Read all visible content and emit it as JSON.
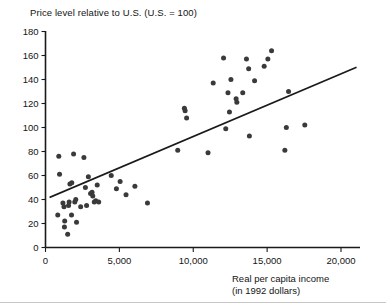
{
  "chart_data": {
    "type": "scatter",
    "title": "Price level relative to U.S. (U.S. = 100)",
    "xlabel": "Real per capita income",
    "xlabel_sub": "(in 1992 dollars)",
    "ylabel": "Price level relative to U.S. (U.S. = 100)",
    "xlim": [
      0,
      21500
    ],
    "ylim": [
      0,
      180
    ],
    "xticks": [
      0,
      5000,
      10000,
      15000,
      20000
    ],
    "xtick_labels": [
      "0",
      "5,000",
      "10,000",
      "15,000",
      "20,000"
    ],
    "yticks": [
      0,
      20,
      40,
      60,
      80,
      100,
      120,
      140,
      160,
      180
    ],
    "ytick_labels": [
      "0",
      "20",
      "40",
      "60",
      "80",
      "100",
      "120",
      "140",
      "160",
      "180"
    ],
    "grid": false,
    "legend": false,
    "point_color": "#3a3a3a",
    "line_color": "#1a1a1a",
    "series": [
      {
        "name": "Countries",
        "marker": "circle",
        "points": [
          [
            900,
            76
          ],
          [
            950,
            61
          ],
          [
            830,
            27
          ],
          [
            1180,
            37
          ],
          [
            1250,
            34
          ],
          [
            1300,
            22
          ],
          [
            1280,
            17
          ],
          [
            1500,
            11
          ],
          [
            1560,
            35
          ],
          [
            1600,
            38
          ],
          [
            1650,
            53
          ],
          [
            1780,
            54
          ],
          [
            1760,
            27
          ],
          [
            1900,
            78
          ],
          [
            1980,
            38
          ],
          [
            2050,
            40
          ],
          [
            2100,
            21
          ],
          [
            2380,
            34
          ],
          [
            2600,
            75
          ],
          [
            2700,
            50
          ],
          [
            2780,
            35
          ],
          [
            2900,
            59
          ],
          [
            3050,
            45
          ],
          [
            3150,
            46
          ],
          [
            3200,
            43
          ],
          [
            3300,
            38
          ],
          [
            3400,
            39
          ],
          [
            3500,
            52
          ],
          [
            3600,
            38
          ],
          [
            4450,
            60
          ],
          [
            4800,
            49
          ],
          [
            5050,
            55
          ],
          [
            5450,
            44
          ],
          [
            6050,
            51
          ],
          [
            6900,
            37
          ],
          [
            8950,
            81
          ],
          [
            9400,
            116
          ],
          [
            9450,
            114
          ],
          [
            9550,
            108
          ],
          [
            11000,
            79
          ],
          [
            11350,
            137
          ],
          [
            12050,
            158
          ],
          [
            12200,
            99
          ],
          [
            12350,
            129
          ],
          [
            12450,
            113
          ],
          [
            12550,
            140
          ],
          [
            12900,
            124
          ],
          [
            12950,
            121
          ],
          [
            13350,
            129
          ],
          [
            13600,
            157
          ],
          [
            13750,
            149
          ],
          [
            13800,
            93
          ],
          [
            14150,
            139
          ],
          [
            14800,
            151
          ],
          [
            15050,
            157
          ],
          [
            15300,
            164
          ],
          [
            16200,
            81
          ],
          [
            16300,
            100
          ],
          [
            16450,
            130
          ],
          [
            17550,
            102
          ]
        ]
      }
    ],
    "trendline": {
      "name": "fitted regression line",
      "x_start": 330,
      "y_start": 42,
      "x_end": 21000,
      "y_end": 150
    }
  }
}
